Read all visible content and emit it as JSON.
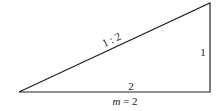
{
  "diagram": {
    "shape": "right-triangle",
    "vertices": {
      "left": [
        19,
        92
      ],
      "right_bottom": [
        210,
        92
      ],
      "top": [
        210,
        3
      ]
    },
    "labels": {
      "hypotenuse": "1 : 2",
      "vertical_side": "1",
      "horizontal_side": "2",
      "caption_var": "m",
      "caption_rest": " = 2"
    },
    "colors": {
      "stroke": "#222222",
      "text": "#222222",
      "background": "#ffffff"
    }
  }
}
